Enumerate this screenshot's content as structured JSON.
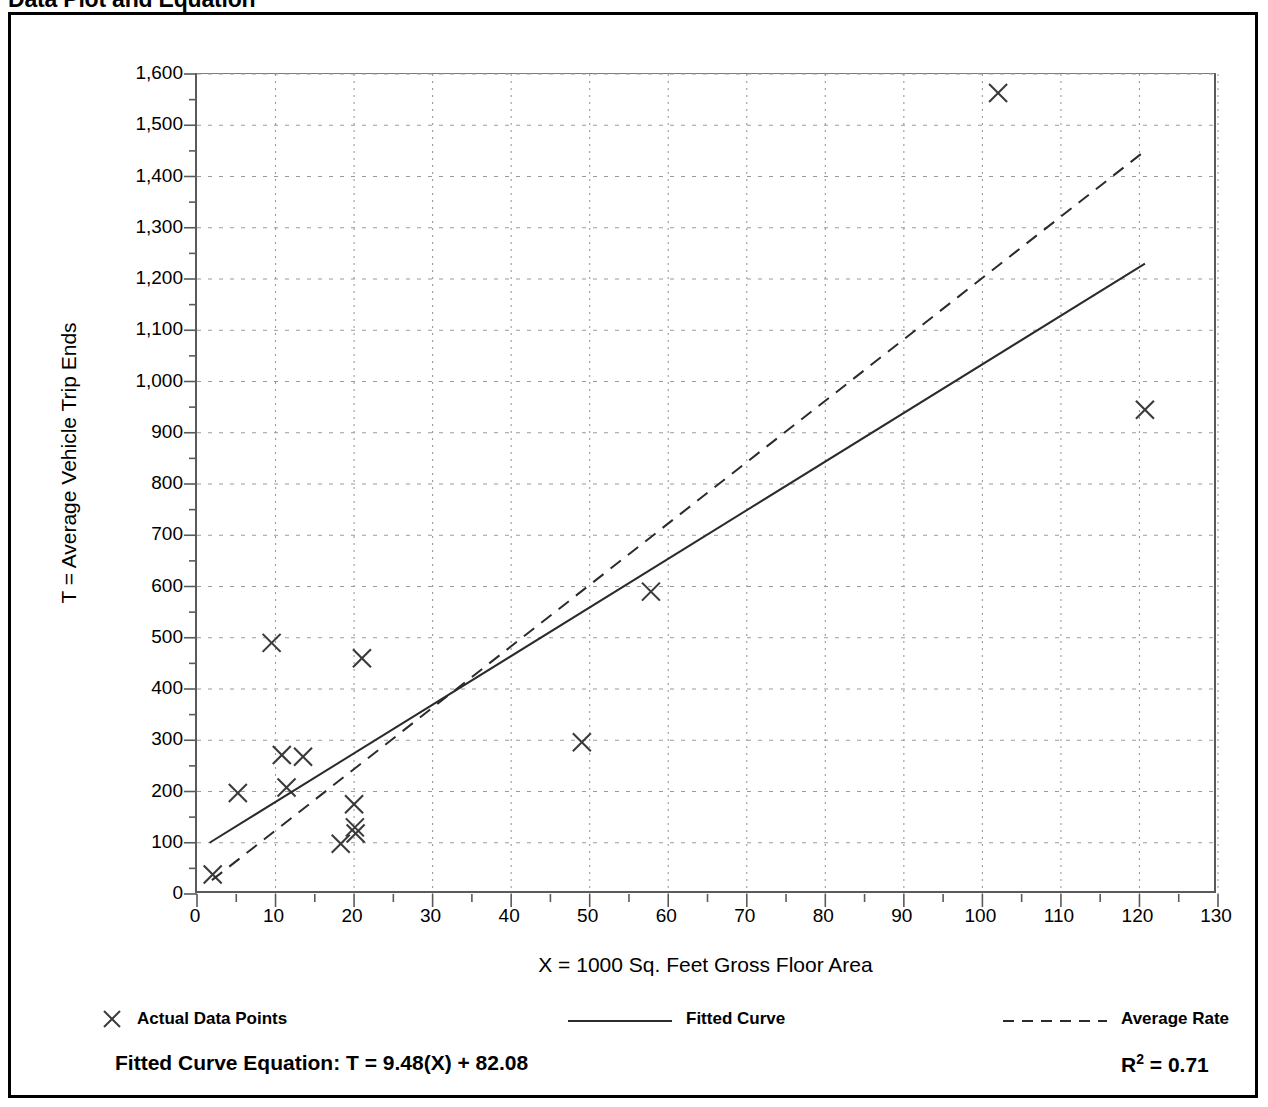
{
  "page": {
    "title": "Data Plot and Equation"
  },
  "legend": {
    "items": [
      {
        "label": "Actual Data Points",
        "marker": "x-marker",
        "left_px": 0
      },
      {
        "label": "Fitted Curve",
        "marker": "solid-line",
        "left_px": 467
      },
      {
        "label": "Average Rate",
        "marker": "dashed-line",
        "left_px": 902
      }
    ]
  },
  "equation": {
    "fitted_curve_label": "Fitted Curve Equation:  T = 9.48(X) + 82.08",
    "r_squared_prefix": "R",
    "r_squared_exponent": "2",
    "r_squared_value": " = 0.71"
  },
  "chart_data": {
    "type": "scatter",
    "title": "Data Plot and Equation",
    "xlabel": "X = 1000 Sq. Feet Gross Floor Area",
    "ylabel": "T = Average Vehicle Trip Ends",
    "xlim": [
      0,
      130
    ],
    "ylim": [
      0,
      1600
    ],
    "x_major_step": 10,
    "x_minor_step": 5,
    "y_major_step": 100,
    "y_minor_step": 50,
    "grid": true,
    "grid_style": "dotted",
    "legend_position": "below-axis",
    "xticks": [
      0,
      10,
      20,
      30,
      40,
      50,
      60,
      70,
      80,
      90,
      100,
      110,
      120,
      130
    ],
    "xtick_labels": [
      "0",
      "10",
      "20",
      "30",
      "40",
      "50",
      "60",
      "70",
      "80",
      "90",
      "100",
      "110",
      "120",
      "130"
    ],
    "yticks": [
      0,
      100,
      200,
      300,
      400,
      500,
      600,
      700,
      800,
      900,
      1000,
      1100,
      1200,
      1300,
      1400,
      1500,
      1600
    ],
    "ytick_labels": [
      "0",
      "100",
      "200",
      "300",
      "400",
      "500",
      "600",
      "700",
      "800",
      "900",
      "1,000",
      "1,100",
      "1,200",
      "1,300",
      "1,400",
      "1,500",
      "1,600"
    ],
    "series": [
      {
        "name": "Actual Data Points",
        "type": "scatter",
        "marker": "x",
        "color": "#3a3a3a",
        "points": [
          [
            2.0,
            38
          ],
          [
            5.2,
            197
          ],
          [
            9.5,
            490
          ],
          [
            10.8,
            271
          ],
          [
            11.4,
            208
          ],
          [
            13.5,
            268
          ],
          [
            18.3,
            98
          ],
          [
            20.0,
            175
          ],
          [
            20.1,
            130
          ],
          [
            20.2,
            118
          ],
          [
            21.0,
            460
          ],
          [
            49.0,
            296
          ],
          [
            57.8,
            590
          ],
          [
            102.0,
            1563
          ],
          [
            120.7,
            945
          ]
        ]
      },
      {
        "name": "Fitted Curve",
        "type": "line",
        "style": "solid",
        "color": "#2b2b2b",
        "equation": "T = 9.48(X) + 82.08",
        "slope": 9.48,
        "intercept": 82.08,
        "r_squared": 0.71,
        "endpoints": [
          [
            1.6,
            100
          ],
          [
            120.7,
            1230
          ]
        ]
      },
      {
        "name": "Average Rate",
        "type": "line",
        "style": "dashed",
        "color": "#2b2b2b",
        "endpoints": [
          [
            1.9,
            27
          ],
          [
            120.7,
            1450
          ]
        ]
      }
    ]
  }
}
